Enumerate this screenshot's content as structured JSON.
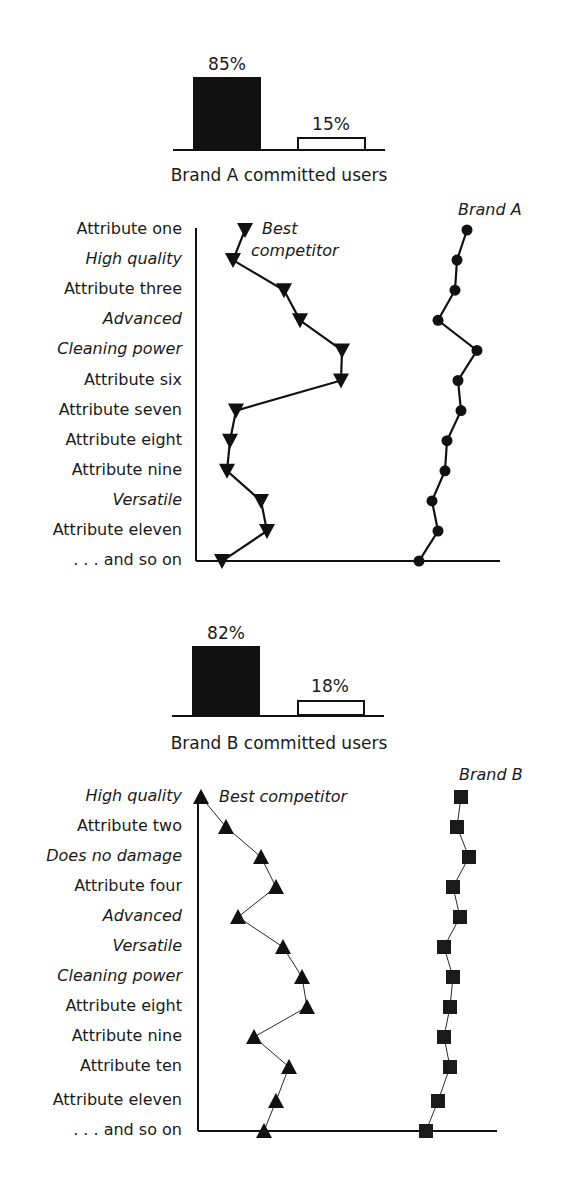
{
  "chart_data": [
    {
      "type": "bar",
      "title": "Brand A committed users",
      "categories": [
        "Committed",
        "Not committed"
      ],
      "values": [
        85,
        15
      ],
      "value_labels": [
        "85%",
        "15%"
      ],
      "colors": [
        "#111111",
        "#ffffff"
      ],
      "ylim": [
        0,
        100
      ],
      "grid": false
    },
    {
      "type": "line",
      "orientation": "horizontal-profile",
      "categories": [
        "Attribute one",
        "High quality",
        "Attribute three",
        "Advanced",
        "Cleaning power",
        "Attribute six",
        "Attribute seven",
        "Attribute eight",
        "Attribute nine",
        "Versatile",
        "Attribute eleven",
        ". . . and so on"
      ],
      "italic_categories": [
        "High quality",
        "Advanced",
        "Cleaning power",
        "Versatile"
      ],
      "series": [
        {
          "name": "Best competitor",
          "marker": "triangle-down",
          "values": [
            50,
            38,
            89,
            105,
            147,
            146,
            41,
            35,
            32,
            66,
            72,
            27
          ]
        },
        {
          "name": "Brand A",
          "marker": "circle",
          "values": [
            272,
            262,
            260,
            243,
            282,
            263,
            266,
            252,
            250,
            237,
            243,
            224
          ]
        }
      ],
      "xlabel": "",
      "ylabel": "",
      "grid": false,
      "axis_ticks": false
    },
    {
      "type": "bar",
      "title": "Brand B committed users",
      "categories": [
        "Committed",
        "Not committed"
      ],
      "values": [
        82,
        18
      ],
      "value_labels": [
        "82%",
        "18%"
      ],
      "colors": [
        "#111111",
        "#ffffff"
      ],
      "ylim": [
        0,
        100
      ],
      "grid": false
    },
    {
      "type": "line",
      "orientation": "horizontal-profile",
      "categories": [
        "High quality",
        "Attribute two",
        "Does no damage",
        "Attribute four",
        "Advanced",
        "Versatile",
        "Cleaning power",
        "Attribute eight",
        "Attribute nine",
        "Attribute ten",
        "Attribute eleven",
        ". . . and so on"
      ],
      "italic_categories": [
        "High quality",
        "Does no damage",
        "Advanced",
        "Versatile",
        "Cleaning power"
      ],
      "series": [
        {
          "name": "Best competitor",
          "marker": "triangle-up",
          "values": [
            3,
            28,
            63,
            78,
            40,
            85,
            104,
            109,
            56,
            91,
            78,
            66
          ]
        },
        {
          "name": "Brand B",
          "marker": "square",
          "values": [
            263,
            259,
            271,
            255,
            262,
            246,
            255,
            252,
            246,
            252,
            240,
            228
          ]
        }
      ],
      "xlabel": "",
      "ylabel": "",
      "grid": false,
      "axis_ticks": false
    }
  ],
  "charts": {
    "a_bar": {
      "pct_black": "85%",
      "pct_white": "15%",
      "caption": "Brand A committed users"
    },
    "a_profile": {
      "competitor_label_1": "Best",
      "competitor_label_2": "competitor",
      "brand_label": "Brand A",
      "rows": [
        {
          "label": "Attribute one",
          "italic": false,
          "comp_x": 245,
          "brand_x": 467
        },
        {
          "label": "High quality",
          "italic": true,
          "comp_x": 233,
          "brand_x": 457
        },
        {
          "label": "Attribute three",
          "italic": false,
          "comp_x": 284,
          "brand_x": 455
        },
        {
          "label": "Advanced",
          "italic": true,
          "comp_x": 300,
          "brand_x": 438
        },
        {
          "label": "Cleaning power",
          "italic": true,
          "comp_x": 342,
          "brand_x": 477
        },
        {
          "label": "Attribute six",
          "italic": false,
          "comp_x": 341,
          "brand_x": 458
        },
        {
          "label": "Attribute seven",
          "italic": false,
          "comp_x": 236,
          "brand_x": 461
        },
        {
          "label": "Attribute eight",
          "italic": false,
          "comp_x": 230,
          "brand_x": 447
        },
        {
          "label": "Attribute nine",
          "italic": false,
          "comp_x": 227,
          "brand_x": 445
        },
        {
          "label": "Versatile",
          "italic": true,
          "comp_x": 261,
          "brand_x": 432
        },
        {
          "label": "Attribute eleven",
          "italic": false,
          "comp_x": 267,
          "brand_x": 438
        },
        {
          "label": ". . . and so on",
          "italic": false,
          "comp_x": 222,
          "brand_x": 419
        }
      ]
    },
    "b_bar": {
      "pct_black": "82%",
      "pct_white": "18%",
      "caption": "Brand B committed users"
    },
    "b_profile": {
      "competitor_label": "Best competitor",
      "brand_label": "Brand B",
      "rows": [
        {
          "label": "High quality",
          "italic": true,
          "comp_x": 201,
          "brand_x": 461
        },
        {
          "label": "Attribute two",
          "italic": false,
          "comp_x": 226,
          "brand_x": 457
        },
        {
          "label": "Does no damage",
          "italic": true,
          "comp_x": 261,
          "brand_x": 469
        },
        {
          "label": "Attribute four",
          "italic": false,
          "comp_x": 276,
          "brand_x": 453
        },
        {
          "label": "Advanced",
          "italic": true,
          "comp_x": 238,
          "brand_x": 460
        },
        {
          "label": "Versatile",
          "italic": true,
          "comp_x": 283,
          "brand_x": 444
        },
        {
          "label": "Cleaning power",
          "italic": true,
          "comp_x": 302,
          "brand_x": 453
        },
        {
          "label": "Attribute eight",
          "italic": false,
          "comp_x": 307,
          "brand_x": 450
        },
        {
          "label": "Attribute nine",
          "italic": false,
          "comp_x": 254,
          "brand_x": 444
        },
        {
          "label": "Attribute ten",
          "italic": false,
          "comp_x": 289,
          "brand_x": 450
        },
        {
          "label": "Attribute eleven",
          "italic": false,
          "comp_x": 276,
          "brand_x": 438
        },
        {
          "label": ". . . and so on",
          "italic": false,
          "comp_x": 264,
          "brand_x": 426
        }
      ]
    }
  }
}
